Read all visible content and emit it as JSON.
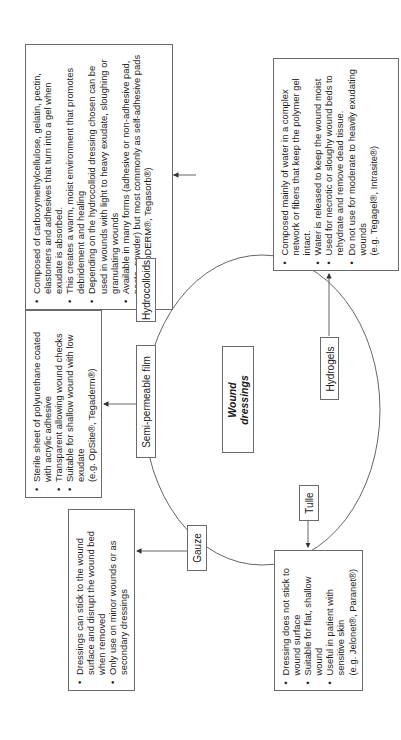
{
  "center": {
    "title_line1": "Wound",
    "title_line2": "dressings"
  },
  "categories": [
    {
      "id": "hydrocolloids",
      "label": "Hydrocolloids",
      "details": [
        "Composed of carboxymethylcellulose, gelatin, pectin, elastomers and adhesives that turn into a gel when exudate is absorbed.",
        "This creates a warm, moist environment that promotes debridement and healing",
        "Depending on the hydrocolloid dressing chosen can be used in wounds with light to heavy exudate, sloughing or granulating wounds",
        "Available in many forms (adhesive or non-adhesive pad, paste, powder) but most commonly as self-adhesive pads"
      ],
      "examples": "(e.g. DuoDERM®, Tegasorb®)"
    },
    {
      "id": "hydrogels",
      "label": "Hydrogels",
      "details": [
        "Composed mainly of water in a complex network or fibers that keep the polymer gel intact.",
        "Water is released to keep the wound moist",
        "Used for necrotic or sloughy wound beds to rehydrate and remove dead tissue.",
        "Do not use for moderate to heavily exudating wounds"
      ],
      "examples": "(e.g. Tegagel®, Intrasite®)"
    },
    {
      "id": "semi-permeable-film",
      "label": "Semi-permeable film",
      "details": [
        "Sterile sheet of polyurethane coated with acrylic adhesive",
        "Transparent allowing wound checks",
        "Suitable for shallow wound with low exudate"
      ],
      "examples": "(e.g. OpSite®, Tegaderm®)"
    },
    {
      "id": "gauze",
      "label": "Gauze",
      "details": [
        "Dressings can stick to the wound surface and disrupt the wound bed when removed",
        "Only use on minor wounds or as secondary dressings"
      ],
      "examples": ""
    },
    {
      "id": "tulle",
      "label": "Tulle",
      "details": [
        "Dressing does not stick to wound surface",
        "Suitable for flat, shallow wound",
        "Useful in patient with sensitive skin"
      ],
      "examples": "(e.g. Jelonet®, Paranet®)"
    }
  ],
  "colors": {
    "line": "#555555",
    "border": "#6b6b6b",
    "text": "#1a1a1a"
  }
}
